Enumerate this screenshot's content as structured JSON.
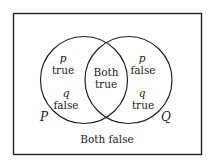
{
  "diagram": {
    "type": "venn",
    "sets": {
      "left": {
        "name": "P"
      },
      "right": {
        "name": "Q"
      }
    },
    "regions": {
      "left_only": {
        "var1": "p",
        "val1": "true",
        "var2": "q",
        "val2": "false"
      },
      "intersection": {
        "line1": "Both",
        "line2": "true"
      },
      "right_only": {
        "var1": "p",
        "val1": "false",
        "var2": "q",
        "val2": "true"
      },
      "outside": {
        "label": "Both false"
      }
    },
    "colors": {
      "stroke": "#222222",
      "background": "#ffffff"
    }
  }
}
